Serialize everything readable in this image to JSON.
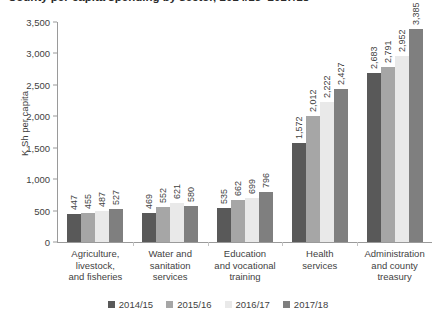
{
  "chart_data": {
    "type": "bar",
    "title": "",
    "xlabel": "",
    "ylabel": "K Sh per capita",
    "ylim": [
      0,
      3500
    ],
    "ytick_labels": [
      "0",
      "500",
      "1,000",
      "1,500",
      "2,000",
      "2,500",
      "3,000",
      "3,500"
    ],
    "ytick_values": [
      0,
      500,
      1000,
      1500,
      2000,
      2500,
      3000,
      3500
    ],
    "grid": false,
    "legend_position": "bottom",
    "categories": [
      "Agriculture, livestock, and fisheries",
      "Water and sanitation services",
      "Education and vocational training",
      "Health services",
      "Administration and county treasury"
    ],
    "category_lines": [
      [
        "Agriculture,",
        "livestock,",
        "and fisheries"
      ],
      [
        "Water and",
        "sanitation",
        "services"
      ],
      [
        "Education",
        "and vocational",
        "training"
      ],
      [
        "Health",
        "services"
      ],
      [
        "Administration",
        "and county",
        "treasury"
      ]
    ],
    "series": [
      {
        "name": "2014/15",
        "color": "#595959",
        "values": [
          447,
          469,
          535,
          1572,
          2683
        ],
        "labels": [
          "447",
          "469",
          "535",
          "1,572",
          "2,683"
        ]
      },
      {
        "name": "2015/16",
        "color": "#a6a6a6",
        "values": [
          455,
          552,
          662,
          2012,
          2791
        ],
        "labels": [
          "455",
          "552",
          "662",
          "2,012",
          "2,791"
        ]
      },
      {
        "name": "2016/17",
        "color": "#e9e9e9",
        "values": [
          487,
          621,
          699,
          2222,
          2952
        ],
        "labels": [
          "487",
          "621",
          "699",
          "2,222",
          "2,952"
        ]
      },
      {
        "name": "2017/18",
        "color": "#7f7f7f",
        "values": [
          527,
          580,
          796,
          2427,
          3385
        ],
        "labels": [
          "527",
          "580",
          "796",
          "2,427",
          "3,385"
        ]
      }
    ]
  },
  "title_strip": {
    "text": "County per capita spending by sector, 2014/15–2017/18"
  },
  "axis": {
    "y_title": "K Sh per capita"
  }
}
